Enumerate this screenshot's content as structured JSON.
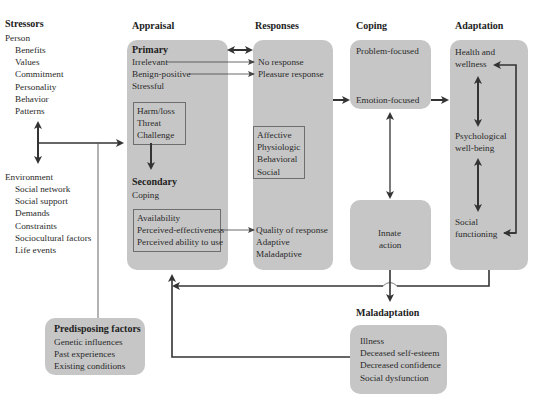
{
  "stressors": {
    "title": "Stressors",
    "person": {
      "label": "Person",
      "items": [
        "Benefits",
        "Values",
        "Commitment",
        "Personality",
        "Behavior",
        "Patterns"
      ]
    },
    "environment": {
      "label": "Environment",
      "items": [
        "Social network",
        "Social support",
        "Demands",
        "Constraints",
        "Sociocultural factors",
        "Life events"
      ]
    }
  },
  "appraisal": {
    "title": "Appraisal",
    "primary": {
      "label": "Primary",
      "items": [
        "Irrelevant",
        "Benign-positive",
        "Stressful"
      ],
      "stressful_types": [
        "Harm/loss",
        "Threat",
        "Challenge"
      ]
    },
    "secondary": {
      "label": "Secondary",
      "sub": "Coping",
      "resources": [
        "Availability",
        "Perceived-effectiveness",
        "Perceived ability to use"
      ]
    }
  },
  "responses": {
    "title": "Responses",
    "items": [
      "No response",
      "Pleasure response"
    ],
    "types": [
      "Affective",
      "Physiologic",
      "Behavioral",
      "Social"
    ],
    "quality": [
      "Quality of response",
      "Adaptive",
      "Maladaptive"
    ]
  },
  "coping": {
    "title": "Coping",
    "items": [
      "Problem-focused",
      "Emotion-focused"
    ],
    "innate": [
      "Innate",
      "action"
    ]
  },
  "adaptation": {
    "title": "Adaptation",
    "items": [
      {
        "line1": "Health and",
        "line2": "wellness"
      },
      {
        "line1": "Psychological",
        "line2": "well-being"
      },
      {
        "line1": "Social",
        "line2": "functioning"
      }
    ]
  },
  "maladaptation": {
    "title": "Maladaptation",
    "items": [
      "Illness",
      "Deceased self-esteem",
      "Decreased confidence",
      "Social dysfunction"
    ]
  },
  "predisposing": {
    "title": "Predisposing factors",
    "items": [
      "Genetic influences",
      "Past experiences",
      "Existing conditions"
    ]
  },
  "colors": {
    "box_fill": "#c6c6c6",
    "arrow": "#333333",
    "thin_line": "#555555"
  }
}
